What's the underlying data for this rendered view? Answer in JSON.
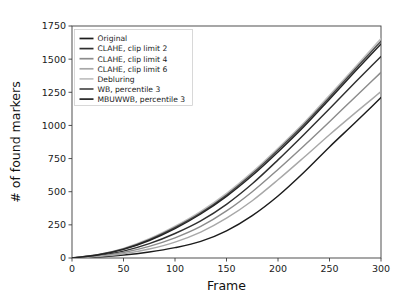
{
  "chart_data": {
    "type": "line",
    "title": "",
    "xlabel": "Frame",
    "ylabel": "# of found markers",
    "xlim": [
      0,
      300
    ],
    "ylim": [
      0,
      1750
    ],
    "xticks": [
      0,
      50,
      100,
      150,
      200,
      250,
      300
    ],
    "yticks": [
      0,
      250,
      500,
      750,
      1000,
      1250,
      1500,
      1750
    ],
    "grid": false,
    "legend_position": "upper left",
    "x": [
      0,
      25,
      50,
      75,
      100,
      125,
      150,
      175,
      200,
      225,
      250,
      275,
      300
    ],
    "series": [
      {
        "name": "Original",
        "color": "#1c1c1c",
        "values": [
          0,
          8,
          22,
          45,
          78,
          125,
          205,
          320,
          468,
          645,
          838,
          1022,
          1210
        ]
      },
      {
        "name": "CLAHE, clip limit 2",
        "color": "#2f2f2f",
        "values": [
          0,
          18,
          52,
          108,
          185,
          280,
          405,
          560,
          740,
          930,
          1125,
          1325,
          1520
        ]
      },
      {
        "name": "CLAHE, clip limit 4",
        "color": "#8c8c8c",
        "values": [
          0,
          14,
          42,
          88,
          152,
          238,
          355,
          500,
          668,
          845,
          1028,
          1215,
          1400
        ]
      },
      {
        "name": "CLAHE, clip limit 6",
        "color": "#a8a8a8",
        "values": [
          0,
          11,
          32,
          68,
          120,
          195,
          300,
          432,
          590,
          758,
          930,
          1095,
          1255
        ]
      },
      {
        "name": "Debluring",
        "color": "#c0c0c0",
        "values": [
          0,
          25,
          72,
          145,
          240,
          352,
          488,
          648,
          828,
          1018,
          1228,
          1440,
          1655
        ]
      },
      {
        "name": "WB, percentile 3",
        "color": "#4a4a4a",
        "values": [
          0,
          24,
          68,
          138,
          230,
          340,
          475,
          635,
          815,
          1005,
          1212,
          1425,
          1635
        ]
      },
      {
        "name": "MBUWWB, percentile 3",
        "color": "#232323",
        "values": [
          0,
          22,
          65,
          132,
          222,
          332,
          465,
          622,
          800,
          990,
          1198,
          1408,
          1615
        ]
      }
    ],
    "legend_entries": [
      "Original",
      "CLAHE, clip limit 2",
      "CLAHE, clip limit 4",
      "CLAHE, clip limit 6",
      "Debluring",
      "WB, percentile 3",
      "MBUWWB, percentile 3"
    ]
  }
}
